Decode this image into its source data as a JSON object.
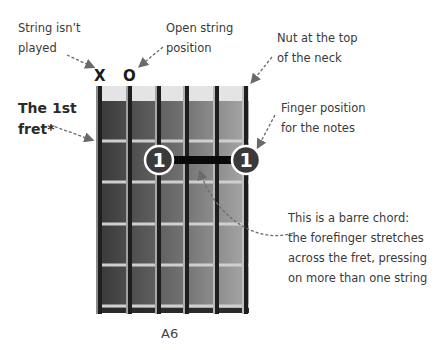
{
  "annotations": {
    "string_not_played": [
      "String isn’t",
      "played"
    ],
    "open_string": [
      "Open string",
      "position"
    ],
    "nut": [
      "Nut at the top",
      "of the neck"
    ],
    "first_fret": [
      "The 1st",
      "fret*"
    ],
    "finger_position": [
      "Finger position",
      "for the notes"
    ],
    "barre": [
      "This is a barre chord:",
      "the forefinger stretches",
      "across the fret, pressing",
      "on more than one string"
    ]
  },
  "markers": {
    "muted": "X",
    "open": "O"
  },
  "chord": {
    "name": "A6",
    "strings": 6,
    "frets_shown": 5,
    "barre": {
      "fret": 1,
      "from_string": 3,
      "to_string": 6,
      "finger": "1"
    }
  },
  "colors": {
    "fretboard_dark": "#3a3a3a",
    "fretboard_light": "#a2a2a2",
    "nut": "#e4e4e4",
    "string": "#1e1e1e",
    "fret_wire": "#c8c8c8",
    "finger_dot": "#3a3a3a",
    "arrow": "#6a6a6a"
  }
}
